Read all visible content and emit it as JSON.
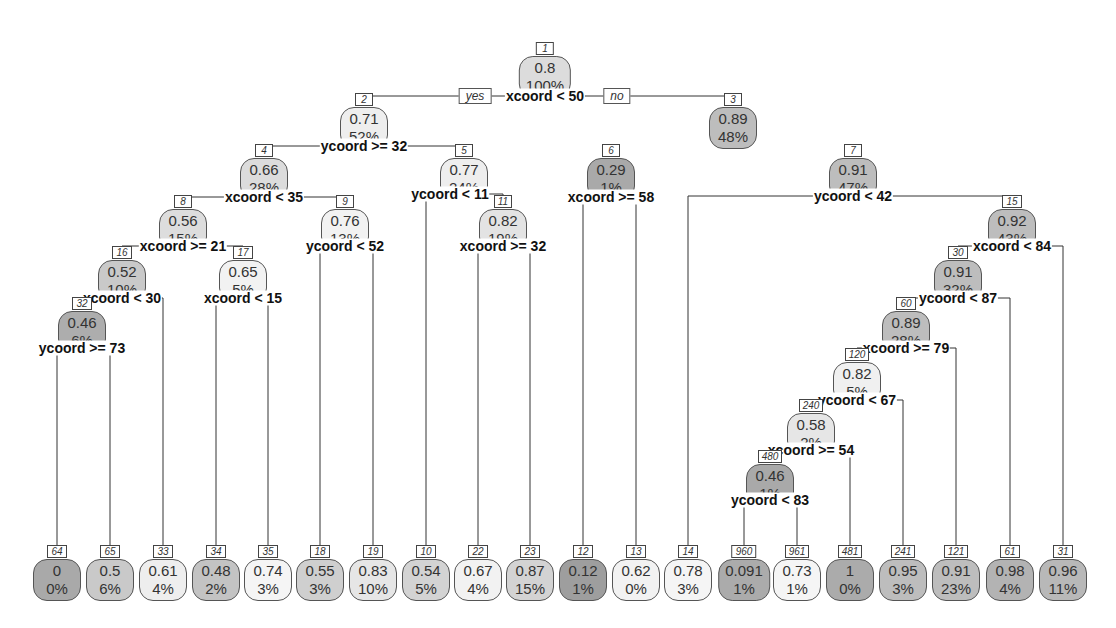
{
  "chart_data": {
    "type": "tree",
    "title": "",
    "colors": {
      "light": "#f0f0f0",
      "mid": "#cccccc",
      "dark": "#a9a9a9",
      "border": "#555555"
    },
    "branch_labels": {
      "yes": "yes",
      "no": "no"
    },
    "nodes": [
      {
        "id": "1",
        "value": "0.8",
        "pct": "100%",
        "x": 545,
        "y": 38,
        "shade": "#dcdcdc",
        "split": "xcoord < 50",
        "sx": 545,
        "sy": 96
      },
      {
        "id": "2",
        "value": "0.71",
        "pct": "52%",
        "x": 364,
        "y": 89,
        "shade": "#eeeeee",
        "split": "ycoord >= 32",
        "sx": 364,
        "sy": 146
      },
      {
        "id": "3",
        "value": "0.89",
        "pct": "48%",
        "x": 733,
        "y": 89,
        "shade": "#bdbdbd"
      },
      {
        "id": "4",
        "value": "0.66",
        "pct": "28%",
        "x": 264,
        "y": 140,
        "shade": "#dcdcdc",
        "split": "xcoord < 35",
        "sx": 264,
        "sy": 197
      },
      {
        "id": "5",
        "value": "0.77",
        "pct": "24%",
        "x": 464,
        "y": 140,
        "shade": "#eeeeee",
        "split": "ycoord < 11",
        "sx": 450,
        "sy": 194
      },
      {
        "id": "6",
        "value": "0.29",
        "pct": "1%",
        "x": 611,
        "y": 140,
        "shade": "#a9a9a9",
        "split": "xcoord >= 58",
        "sx": 611,
        "sy": 197
      },
      {
        "id": "7",
        "value": "0.91",
        "pct": "47%",
        "x": 853,
        "y": 140,
        "shade": "#bdbdbd",
        "split": "ycoord < 42",
        "sx": 853,
        "sy": 196
      },
      {
        "id": "8",
        "value": "0.56",
        "pct": "15%",
        "x": 183,
        "y": 191,
        "shade": "#dddddd",
        "split": "xcoord >= 21",
        "sx": 183,
        "sy": 246
      },
      {
        "id": "9",
        "value": "0.76",
        "pct": "13%",
        "x": 345,
        "y": 191,
        "shade": "#f2f2f2",
        "split": "ycoord < 52",
        "sx": 345,
        "sy": 246
      },
      {
        "id": "11",
        "value": "0.82",
        "pct": "19%",
        "x": 503,
        "y": 191,
        "shade": "#e3e3e3",
        "split": "xcoord >= 32",
        "sx": 503,
        "sy": 246
      },
      {
        "id": "15",
        "value": "0.92",
        "pct": "43%",
        "x": 1012,
        "y": 191,
        "shade": "#bdbdbd",
        "split": "xcoord < 84",
        "sx": 1012,
        "sy": 246
      },
      {
        "id": "16",
        "value": "0.52",
        "pct": "10%",
        "x": 122,
        "y": 242,
        "shade": "#c9c9c9",
        "split": "xcoord < 30",
        "sx": 122,
        "sy": 298
      },
      {
        "id": "17",
        "value": "0.65",
        "pct": "5%",
        "x": 243,
        "y": 242,
        "shade": "#f2f2f2",
        "split": "xcoord < 15",
        "sx": 243,
        "sy": 298
      },
      {
        "id": "30",
        "value": "0.91",
        "pct": "32%",
        "x": 958,
        "y": 242,
        "shade": "#bdbdbd",
        "split": "ycoord < 87",
        "sx": 958,
        "sy": 298
      },
      {
        "id": "32",
        "value": "0.46",
        "pct": "6%",
        "x": 82,
        "y": 293,
        "shade": "#adadad",
        "split": "ycoord >= 73",
        "sx": 82,
        "sy": 348
      },
      {
        "id": "60",
        "value": "0.89",
        "pct": "28%",
        "x": 906,
        "y": 293,
        "shade": "#bdbdbd",
        "split": "xcoord >= 79",
        "sx": 906,
        "sy": 348
      },
      {
        "id": "120",
        "value": "0.82",
        "pct": "5%",
        "x": 857,
        "y": 344,
        "shade": "#f0f0f0",
        "split": "ycoord < 67",
        "sx": 857,
        "sy": 400
      },
      {
        "id": "240",
        "value": "0.58",
        "pct": "2%",
        "x": 811,
        "y": 395,
        "shade": "#e6e6e6",
        "split": "xcoord >= 54",
        "sx": 811,
        "sy": 450
      },
      {
        "id": "480",
        "value": "0.46",
        "pct": "1%",
        "x": 770,
        "y": 446,
        "shade": "#a9a9a9",
        "split": "ycoord < 83",
        "sx": 770,
        "sy": 500
      }
    ],
    "leaves": [
      {
        "id": "64",
        "value": "0",
        "pct": "0%",
        "x": 57,
        "shade": "#a9a9a9"
      },
      {
        "id": "65",
        "value": "0.5",
        "pct": "6%",
        "x": 110,
        "shade": "#c9c9c9"
      },
      {
        "id": "33",
        "value": "0.61",
        "pct": "4%",
        "x": 163,
        "shade": "#eeeeee"
      },
      {
        "id": "34",
        "value": "0.48",
        "pct": "2%",
        "x": 216,
        "shade": "#c3c3c3"
      },
      {
        "id": "35",
        "value": "0.74",
        "pct": "3%",
        "x": 268,
        "shade": "#f5f5f5"
      },
      {
        "id": "18",
        "value": "0.55",
        "pct": "3%",
        "x": 320,
        "shade": "#cfcfcf"
      },
      {
        "id": "19",
        "value": "0.83",
        "pct": "10%",
        "x": 373,
        "shade": "#e6e6e6"
      },
      {
        "id": "10",
        "value": "0.54",
        "pct": "5%",
        "x": 426,
        "shade": "#d3d3d3"
      },
      {
        "id": "22",
        "value": "0.67",
        "pct": "4%",
        "x": 478,
        "shade": "#f2f2f2"
      },
      {
        "id": "23",
        "value": "0.87",
        "pct": "15%",
        "x": 530,
        "shade": "#d3d3d3"
      },
      {
        "id": "12",
        "value": "0.12",
        "pct": "1%",
        "x": 583,
        "shade": "#9e9e9e"
      },
      {
        "id": "13",
        "value": "0.62",
        "pct": "0%",
        "x": 636,
        "shade": "#f2f2f2"
      },
      {
        "id": "14",
        "value": "0.78",
        "pct": "3%",
        "x": 688,
        "shade": "#f5f5f5"
      },
      {
        "id": "960",
        "value": "0.091",
        "pct": "1%",
        "x": 744,
        "shade": "#ababab"
      },
      {
        "id": "961",
        "value": "0.73",
        "pct": "1%",
        "x": 797,
        "shade": "#f5f5f5"
      },
      {
        "id": "481",
        "value": "1",
        "pct": "0%",
        "x": 850,
        "shade": "#ababab"
      },
      {
        "id": "241",
        "value": "0.95",
        "pct": "3%",
        "x": 903,
        "shade": "#bdbdbd"
      },
      {
        "id": "121",
        "value": "0.91",
        "pct": "23%",
        "x": 956,
        "shade": "#bdbdbd"
      },
      {
        "id": "61",
        "value": "0.98",
        "pct": "4%",
        "x": 1010,
        "shade": "#b3b3b3"
      },
      {
        "id": "31",
        "value": "0.96",
        "pct": "11%",
        "x": 1063,
        "shade": "#b8b8b8"
      }
    ],
    "leaf_y": 541
  }
}
